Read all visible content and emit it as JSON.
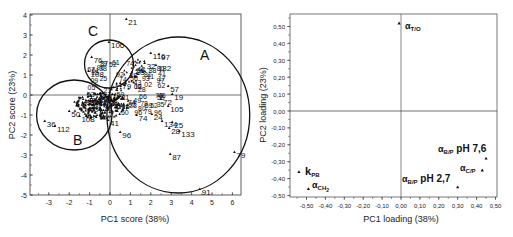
{
  "chart_data": [
    {
      "type": "scatter",
      "title": "",
      "xlabel": "PC1 score (38%)",
      "ylabel": "PC2 score (23%)",
      "xlim": [
        -3.8,
        6.3
      ],
      "ylim": [
        -5,
        4
      ],
      "xticks": [
        -3,
        -2,
        -1,
        0,
        1,
        2,
        3,
        4,
        5,
        6
      ],
      "yticks": [
        4,
        3,
        2,
        1,
        0,
        -1,
        -2,
        -3,
        -4,
        -5
      ],
      "grid": false,
      "points": [
        {
          "label": "21",
          "x": 0.8,
          "y": 3.8
        },
        {
          "label": "106",
          "x": -0.05,
          "y": 2.65
        },
        {
          "label": "76",
          "x": -0.9,
          "y": 1.9
        },
        {
          "label": "108",
          "x": -1.05,
          "y": 1.2
        },
        {
          "label": "116",
          "x": 2.0,
          "y": 2.1
        },
        {
          "label": "97",
          "x": 2.4,
          "y": 2.05
        },
        {
          "label": "32",
          "x": 1.7,
          "y": 1.6
        },
        {
          "label": "182",
          "x": 2.25,
          "y": 1.5
        },
        {
          "label": "79",
          "x": 0.5,
          "y": 0.6
        },
        {
          "label": "57",
          "x": 2.85,
          "y": 0.45
        },
        {
          "label": "19",
          "x": 3.05,
          "y": 0.05
        },
        {
          "label": "72",
          "x": 2.5,
          "y": -0.2
        },
        {
          "label": "105",
          "x": 2.85,
          "y": -0.55
        },
        {
          "label": "74",
          "x": 1.3,
          "y": -1.0
        },
        {
          "label": "24",
          "x": 2.05,
          "y": -0.95
        },
        {
          "label": "134",
          "x": 2.55,
          "y": -1.3
        },
        {
          "label": "25",
          "x": 3.05,
          "y": -1.35
        },
        {
          "label": "28",
          "x": 2.9,
          "y": -1.65
        },
        {
          "label": "133",
          "x": 3.4,
          "y": -1.8
        },
        {
          "label": "96",
          "x": 0.5,
          "y": -1.85
        },
        {
          "label": "87",
          "x": 2.95,
          "y": -2.95
        },
        {
          "label": "79",
          "x": 6.1,
          "y": -2.85
        },
        {
          "label": "91",
          "x": 4.4,
          "y": -4.7
        },
        {
          "label": "50",
          "x": -2.0,
          "y": -0.8
        },
        {
          "label": "36",
          "x": -3.2,
          "y": -1.3
        },
        {
          "label": "112",
          "x": -2.7,
          "y": -1.55
        },
        {
          "label": "108",
          "x": -1.5,
          "y": -1.05
        },
        {
          "label": "41",
          "x": -0.1,
          "y": -1.25
        }
      ],
      "ellipses": [
        {
          "label": "A",
          "cx": 3.35,
          "cy": -1.0,
          "rx": 3.5,
          "ry": 3.9
        },
        {
          "label": "B",
          "cx": -1.75,
          "cy": -1.0,
          "rx": 1.85,
          "ry": 1.75
        },
        {
          "label": "C",
          "cx": -0.05,
          "cy": 1.55,
          "rx": 1.2,
          "ry": 1.2
        }
      ],
      "annotations": [
        "A",
        "B",
        "C"
      ]
    },
    {
      "type": "scatter",
      "title": "",
      "xlabel": "PC1 loading (38%)",
      "ylabel": "PC2 loading (23%)",
      "xlim": [
        -0.58,
        0.5
      ],
      "ylim": [
        -0.5,
        0.57
      ],
      "xticks": [
        "-0,50",
        "-0,40",
        "-0,30",
        "-0,20",
        "-0,10",
        "0,00",
        "0,10",
        "0,20",
        "0,30",
        "0,40",
        "0,50"
      ],
      "yticks": [
        "0,50",
        "0,40",
        "0,30",
        "0,20",
        "0,10",
        "0,00",
        "-0,10",
        "-0,20",
        "-0,30",
        "-0,40",
        "-0,50"
      ],
      "grid": false,
      "points": [
        {
          "label": "αT/O",
          "x": -0.01,
          "y": 0.52
        },
        {
          "label": "kPB",
          "x": -0.54,
          "y": -0.36
        },
        {
          "label": "αCH2",
          "x": -0.49,
          "y": -0.46
        },
        {
          "label": "αB/P pH 7,6",
          "x": 0.45,
          "y": -0.28
        },
        {
          "label": "αC/P",
          "x": 0.43,
          "y": -0.35
        },
        {
          "label": "αB/P pH 2,7",
          "x": 0.3,
          "y": -0.45
        }
      ]
    }
  ],
  "left_chart": {
    "xlabel": "PC1 score (38%)",
    "ylabel": "PC2 score (23%)",
    "xticks": [
      "-3",
      "-2",
      "-1",
      "0",
      "1",
      "2",
      "3",
      "4",
      "5",
      "6"
    ],
    "yticks": [
      "4",
      "3",
      "2",
      "1",
      "0",
      "-1",
      "-2",
      "-3",
      "-4",
      "-5"
    ],
    "group_labels": {
      "A": "A",
      "B": "B",
      "C": "C"
    }
  },
  "right_chart": {
    "xlabel": "PC1 loading (38%)",
    "ylabel": "PC2 loading (23%)",
    "xticks": [
      "-0,50",
      "-0,40",
      "-0,30",
      "-0,20",
      "-0,10",
      "0,00",
      "0,10",
      "0,20",
      "0,30",
      "0,40",
      "0,50"
    ],
    "yticks": [
      "0,50",
      "0,40",
      "0,30",
      "0,20",
      "0,10",
      "0,00",
      "-0,10",
      "-0,20",
      "-0,30",
      "-0,40",
      "-0,50"
    ],
    "labels": {
      "t_o_main": "α",
      "t_o_sub": "T/O",
      "kpb_main": "k",
      "kpb_sub": "PB",
      "ch2_main": "α",
      "ch2_sub": "CH",
      "bp76_main": "α",
      "bp76_sub": "B/P",
      "bp76_suffix": " pH 7,6",
      "cp_main": "α",
      "cp_sub": "C/P",
      "bp27_main": "α",
      "bp27_sub": "B/P",
      "bp27_suffix": " pH 2,7"
    }
  }
}
